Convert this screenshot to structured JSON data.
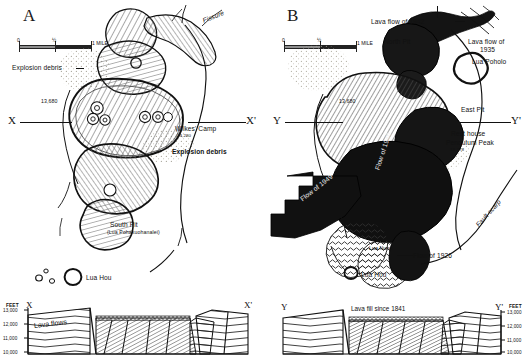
{
  "figure": {
    "caption_present": false,
    "panels": [
      {
        "id": "A",
        "letter": "A",
        "scale": {
          "zero": "0",
          "half": "½",
          "one": "1 MILE"
        },
        "section_label_left": "X",
        "section_label_right": "X'",
        "annotations": [
          {
            "name": "fissure",
            "text": "Fissure"
          },
          {
            "name": "explosion-debris-nw",
            "text": "Explosion debris"
          },
          {
            "name": "elevation-13680",
            "text": "13,680"
          },
          {
            "name": "wilkes-camp",
            "text": "Wilkes' Camp"
          },
          {
            "name": "wilkes-camp-elev",
            "text": "13,280"
          },
          {
            "name": "explosion-debris-se",
            "text": "Explosion debris"
          },
          {
            "name": "south-pit",
            "text": "South Pit"
          },
          {
            "name": "south-pit-native",
            "text": "(Lua Pohakuohanalei)"
          },
          {
            "name": "lua-hou",
            "text": "Lua Hou"
          }
        ],
        "cross_section": {
          "axis_title": "FEET",
          "ticks": [
            "13,000",
            "12,000",
            "11,000",
            "10,000"
          ],
          "left_end": "X",
          "right_end": "X'",
          "unit_label": "Lava flows"
        }
      },
      {
        "id": "B",
        "letter": "B",
        "scale": {
          "zero": "0",
          "half": "½",
          "one": "1 MILE"
        },
        "section_label_left": "Y",
        "section_label_right": "Y'",
        "annotations": [
          {
            "name": "lava-flow-1942",
            "text": "Lava flow of 1942"
          },
          {
            "name": "north-pit",
            "text": "North Pit"
          },
          {
            "name": "lava-flow-1935",
            "text": "Lava flow of"
          },
          {
            "name": "lava-flow-1935-yr",
            "text": "1935"
          },
          {
            "name": "lua-poholo",
            "text": "Lua Poholo"
          },
          {
            "name": "elevation-13680",
            "text": "13,680"
          },
          {
            "name": "east-pit",
            "text": "East Pit"
          },
          {
            "name": "rest-house",
            "text": "Rest house"
          },
          {
            "name": "pendulum-peak",
            "text": "Pendulum Peak"
          },
          {
            "name": "pendulum-peak-elev",
            "text": "13,278"
          },
          {
            "name": "flow-of-1949",
            "text": "Flow of 1949"
          },
          {
            "name": "flow-of-1940",
            "text": "Flow of 1940"
          },
          {
            "name": "south-pit",
            "text": "South Pit"
          },
          {
            "name": "lua-nunu",
            "text": "Lua Nunu"
          },
          {
            "name": "flow-of-1926",
            "text": "Flow of 1926"
          },
          {
            "name": "lua-hou",
            "text": "Lua Hou"
          },
          {
            "name": "fault-scarp",
            "text": "Fault scarp"
          }
        ],
        "cross_section": {
          "axis_title": "FEET",
          "ticks": [
            "13,000",
            "12,000",
            "11,000",
            "10,000"
          ],
          "left_end": "Y",
          "right_end": "Y'",
          "unit_label": "Lava fill since 1841"
        }
      }
    ]
  },
  "colors": {
    "ink": "#111111",
    "paper": "#ffffff",
    "debris": "#c9c6bb",
    "lava_dark": "#1a1a1a",
    "hachure": "#6b6b6b"
  }
}
